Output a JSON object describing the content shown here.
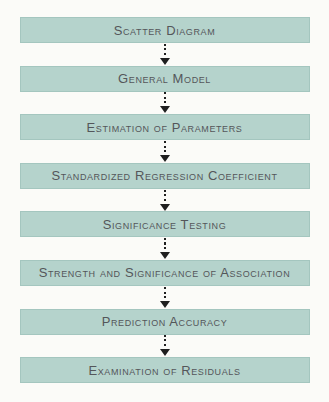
{
  "flowchart": {
    "steps": [
      {
        "label": "Scatter Diagram"
      },
      {
        "label": "General Model"
      },
      {
        "label": "Estimation of Parameters"
      },
      {
        "label": "Standardized Regression Coefficient"
      },
      {
        "label": "Significance Testing"
      },
      {
        "label": "Strength and Significance of Association"
      },
      {
        "label": "Prediction Accuracy"
      },
      {
        "label": "Examination of Residuals"
      }
    ],
    "colors": {
      "background": "#fbfbf8",
      "box_fill": "#b5d3cc",
      "box_border": "#a4c6bf",
      "text": "#54565a",
      "arrow": "#1f1f1f"
    }
  }
}
